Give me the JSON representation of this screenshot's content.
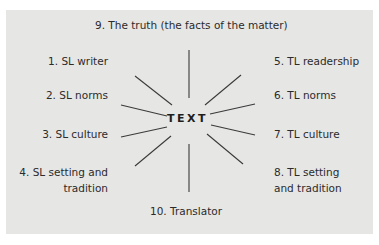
{
  "diagram": {
    "center": "TEXT",
    "top": "9. The truth (the facts of the matter)",
    "bottom": "10. Translator",
    "left": [
      {
        "label": "1. SL writer"
      },
      {
        "label": "2. SL norms"
      },
      {
        "label": "3. SL culture"
      },
      {
        "label_line1": "4. SL setting and",
        "label_line2": "tradition"
      }
    ],
    "right": [
      {
        "label": "5. TL readership"
      },
      {
        "label": "6. TL norms"
      },
      {
        "label": "7. TL culture"
      },
      {
        "label_line1": "8. TL setting",
        "label_line2": "and tradition"
      }
    ],
    "colors": {
      "panel_background": "#e6e6e5",
      "text": "#2b2b2b",
      "lines": "#3a3a3a"
    }
  }
}
